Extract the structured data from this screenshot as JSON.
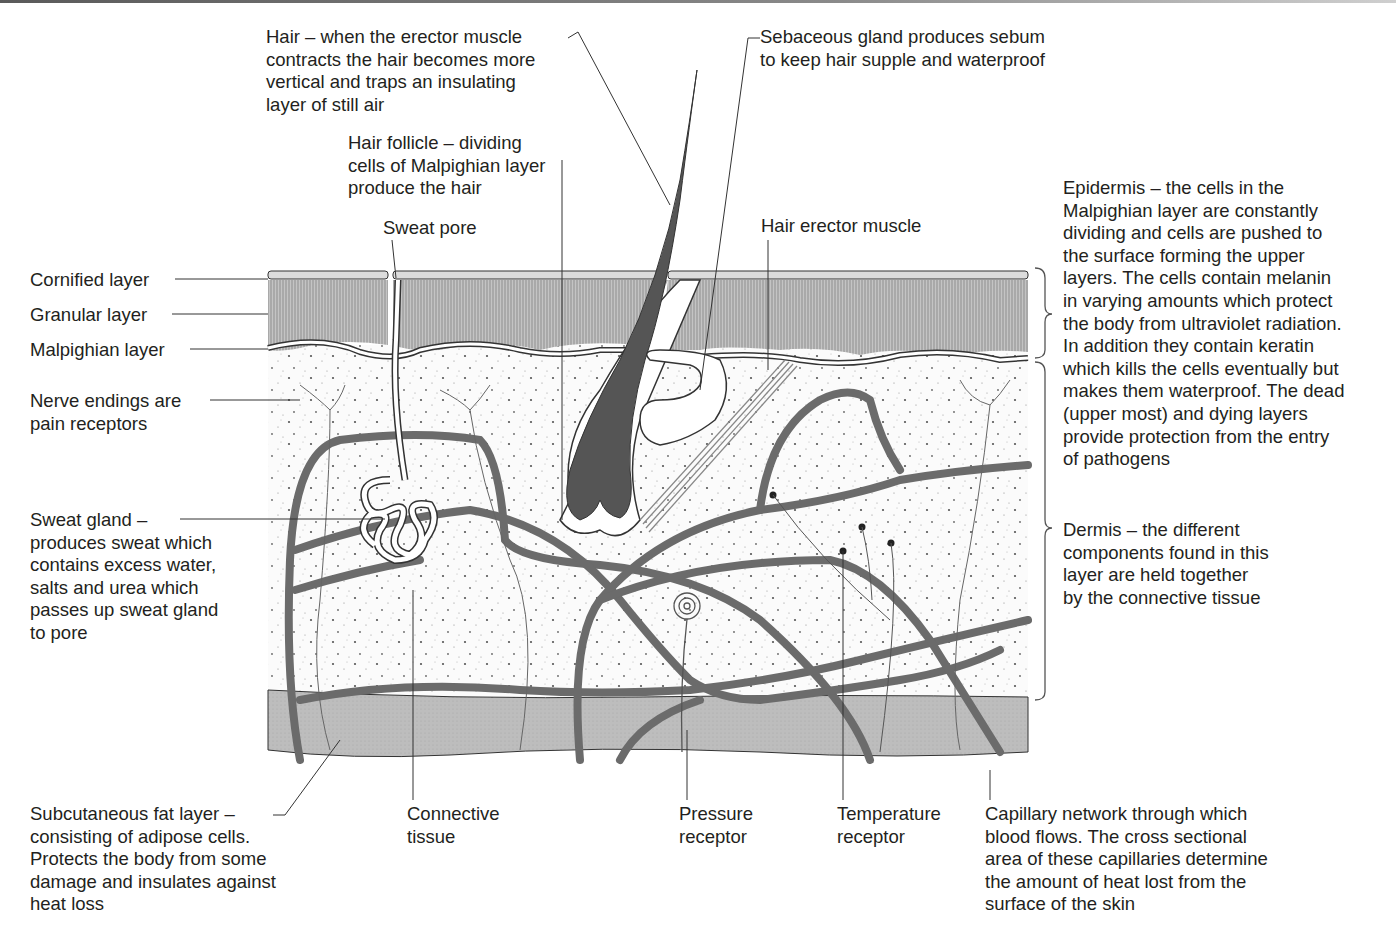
{
  "colors": {
    "epidermis_fill": "#b5b5b5",
    "cornified_fill": "#dcdcdc",
    "dermis_fill": "#fbfbfb",
    "fat_fill": "#b9b9b9",
    "capillary": "#6b6b6b",
    "hair": "#5a5a5a",
    "line": "#231f20"
  },
  "labels": {
    "hair": "Hair – when the erector muscle\ncontracts the hair becomes more\nvertical and traps an insulating\nlayer of still air",
    "sebaceous_gland": "Sebaceous gland produces sebum\nto keep hair supple and waterproof",
    "hair_follicle": "Hair follicle – dividing\ncells of Malpighian layer\nproduce the hair",
    "sweat_pore": "Sweat pore",
    "hair_erector_muscle": "Hair erector muscle",
    "cornified_layer": "Cornified layer",
    "granular_layer": "Granular layer",
    "malpighian_layer": "Malpighian layer",
    "nerve_endings": "Nerve endings are\npain receptors",
    "sweat_gland": "Sweat gland –\nproduces sweat which\ncontains excess water,\nsalts and urea which\npasses up sweat gland\nto pore",
    "epidermis": "Epidermis – the cells in the\nMalpighian layer are constantly\ndividing and cells are pushed to\nthe surface forming the upper\nlayers. The cells contain melanin\nin varying amounts which protect\nthe body from ultraviolet radiation.\nIn addition they contain keratin\nwhich kills the cells eventually but\nmakes them waterproof. The dead\n(upper most) and dying layers\nprovide protection from the entry\nof pathogens",
    "dermis": "Dermis – the different\ncomponents found in this\nlayer are held together\nby the connective tissue",
    "subcutaneous_fat": "Subcutaneous fat layer –\nconsisting of adipose cells.\nProtects the body from some\ndamage and insulates against\nheat loss",
    "connective_tissue": "Connective\ntissue",
    "pressure_receptor": "Pressure\nreceptor",
    "temperature_receptor": "Temperature\nreceptor",
    "capillary_network": "Capillary network through which\nblood flows. The cross sectional\narea of these capillaries determine\nthe amount of heat lost from the\nsurface of the skin"
  }
}
